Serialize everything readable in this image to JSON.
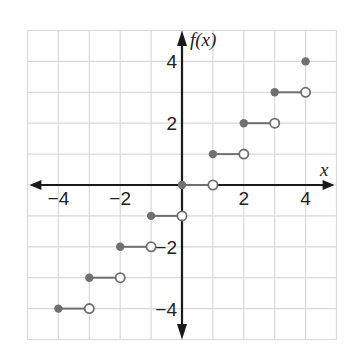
{
  "chart_data": {
    "type": "step",
    "title": "",
    "xlabel": "x",
    "ylabel": "f(x)",
    "xlim": [
      -5,
      5
    ],
    "ylim": [
      -5,
      5
    ],
    "grid": true,
    "x_ticks": [
      -4,
      -2,
      2,
      4
    ],
    "y_ticks": [
      4,
      2,
      -2,
      -4
    ],
    "x_tick_labels": [
      "−4",
      "−2",
      "2",
      "4"
    ],
    "y_tick_labels": [
      "4",
      "2",
      "−2",
      "−4"
    ],
    "segments": [
      {
        "x_start": -4,
        "x_end": -3,
        "y": -4,
        "closed_start": true,
        "open_end": true
      },
      {
        "x_start": -3,
        "x_end": -2,
        "y": -3,
        "closed_start": true,
        "open_end": true
      },
      {
        "x_start": -2,
        "x_end": -1,
        "y": -2,
        "closed_start": true,
        "open_end": true
      },
      {
        "x_start": -1,
        "x_end": 0,
        "y": -1,
        "closed_start": true,
        "open_end": true
      },
      {
        "x_start": 0,
        "x_end": 1,
        "y": 0,
        "closed_start": true,
        "open_end": true
      },
      {
        "x_start": 1,
        "x_end": 2,
        "y": 1,
        "closed_start": true,
        "open_end": true
      },
      {
        "x_start": 2,
        "x_end": 3,
        "y": 2,
        "closed_start": true,
        "open_end": true
      },
      {
        "x_start": 3,
        "x_end": 4,
        "y": 3,
        "closed_start": true,
        "open_end": true
      }
    ],
    "isolated_points": [
      {
        "x": 4,
        "y": 4,
        "filled": true
      }
    ],
    "function": "f(x) = floor(x), domain [-4, 4]"
  },
  "colors": {
    "grid": "#d9d9d9",
    "axis": "#1a1a1a",
    "point": "#707070",
    "segment": "#707070",
    "open_fill": "#ffffff"
  }
}
